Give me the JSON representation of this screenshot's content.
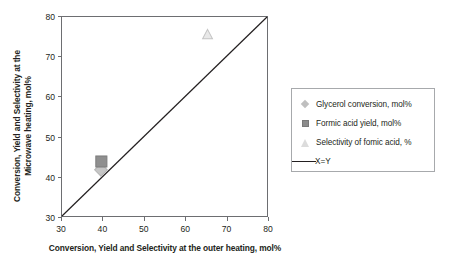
{
  "chart_data": {
    "type": "scatter",
    "title": "",
    "xlabel": "Conversion, Yield and Selectivity at the outer heating, mol%",
    "ylabel_line1": "Conversion, Yield and Selectivity at the",
    "ylabel_line2": "Microwave heating, mol%",
    "xlim": [
      30,
      80
    ],
    "ylim": [
      30,
      80
    ],
    "xticks": [
      "30",
      "40",
      "50",
      "60",
      "70",
      "80"
    ],
    "yticks": [
      "80",
      "70",
      "60",
      "50",
      "40",
      "30"
    ],
    "xtick_values": [
      30,
      40,
      50,
      60,
      70,
      80
    ],
    "ytick_values": [
      80,
      70,
      60,
      50,
      40,
      30
    ],
    "grid": false,
    "legend_position": "right",
    "series": [
      {
        "name": "Glycerol conversion, mol%",
        "marker": "diamond",
        "color": "#bfbfbf",
        "points": [
          {
            "x": 39.5,
            "y": 41.6
          }
        ]
      },
      {
        "name": "Formic acid yield, mol%",
        "marker": "square",
        "color": "#8c8c8c",
        "points": [
          {
            "x": 39.6,
            "y": 43.7
          }
        ]
      },
      {
        "name": "Selectivity of fomic acid, %",
        "marker": "triangle",
        "color": "#e3e3e3",
        "points": [
          {
            "x": 65.5,
            "y": 75.5
          }
        ]
      },
      {
        "name": "X=Y",
        "marker": "line",
        "color": "#231f20",
        "points": [
          {
            "x": 30,
            "y": 30
          },
          {
            "x": 80,
            "y": 80
          }
        ]
      }
    ]
  },
  "legend": {
    "items": [
      {
        "label": "Glycerol conversion, mol%",
        "marker": "diamond-marker"
      },
      {
        "label": "Formic acid yield, mol%",
        "marker": "square-marker"
      },
      {
        "label": "Selectivity of fomic acid, %",
        "marker": "triangle-marker"
      },
      {
        "label": "X=Y",
        "marker": "line-marker"
      }
    ]
  },
  "colors": {
    "axis": "#6d6e71",
    "text": "#231f20",
    "legend_border": "#a7a9ac",
    "identity_line": "#231f20"
  }
}
